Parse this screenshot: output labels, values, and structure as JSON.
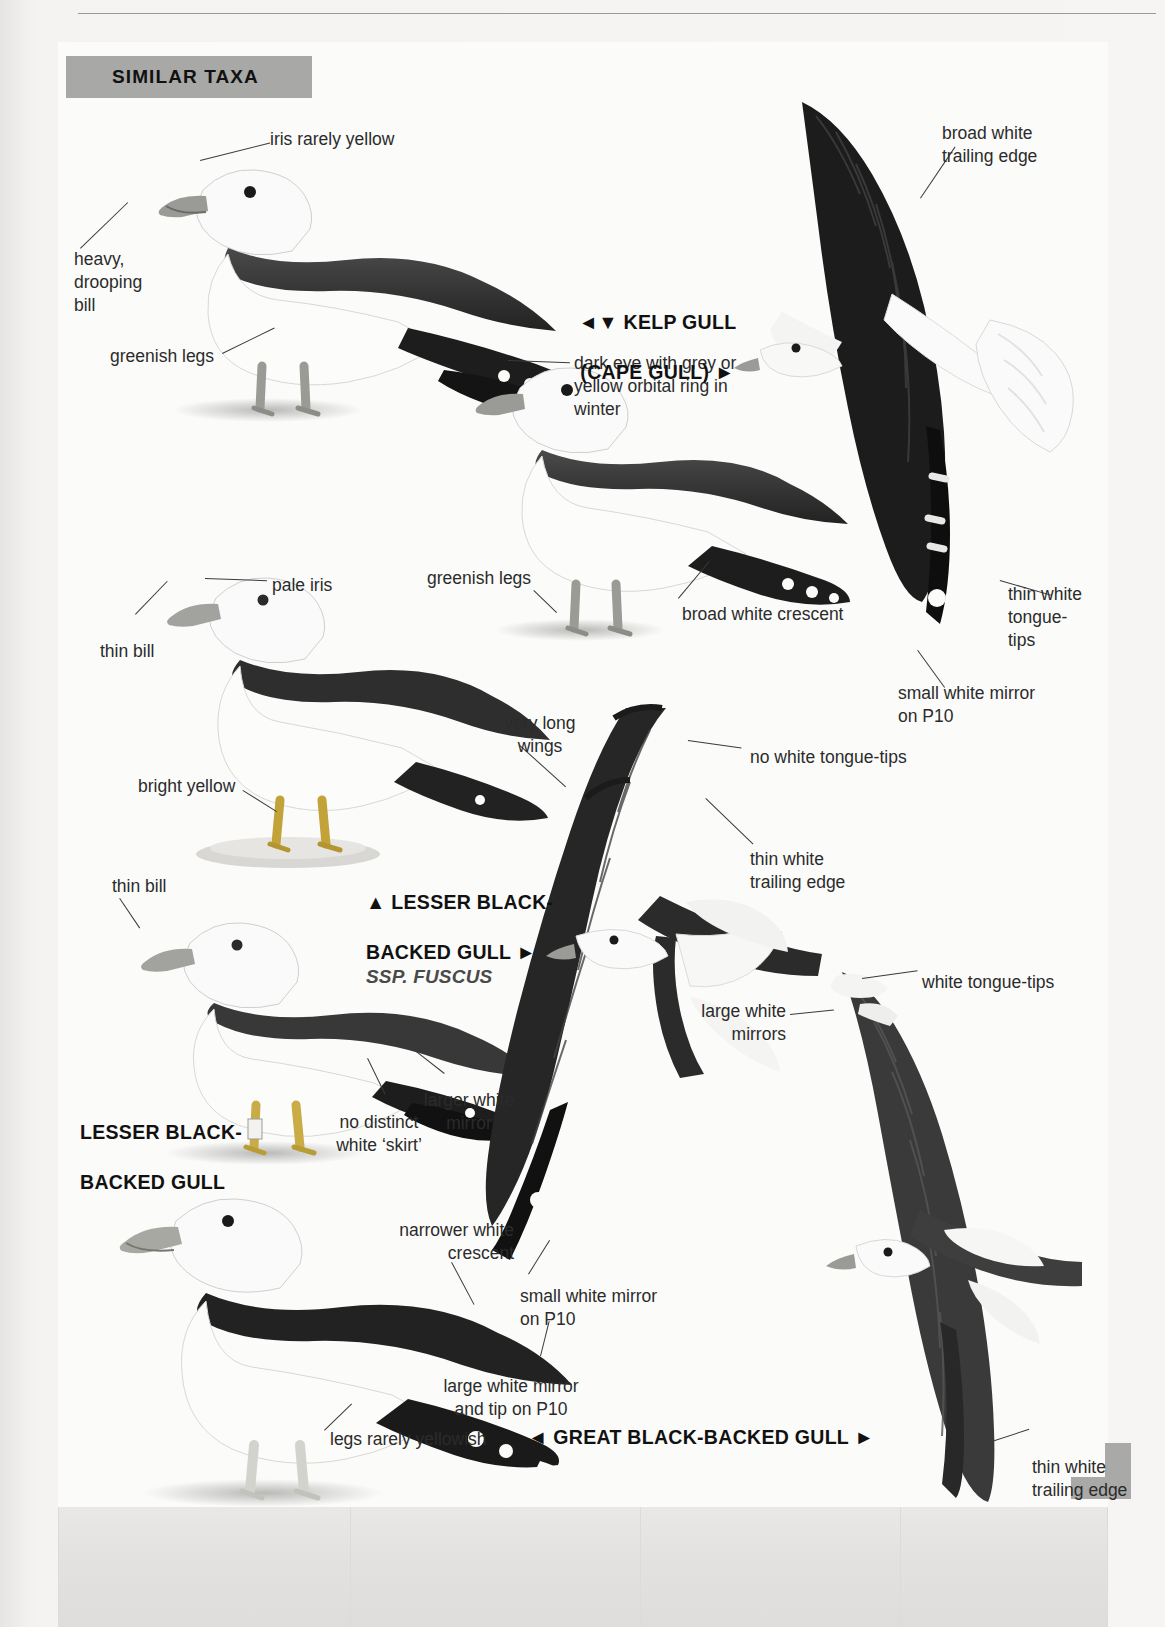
{
  "page": {
    "section_header": "SIMILAR TAXA",
    "accent_grey": "#a8a8a6",
    "paper": "#fbfbfa",
    "text_color": "#2b2b2b"
  },
  "species_labels": [
    {
      "id": "kelp-gull",
      "line1": "◄▼ KELP GULL",
      "line2": "(CAPE GULL) ►",
      "ssp": ""
    },
    {
      "id": "lesser-black-backed-gull-fuscus",
      "line1": "▲ LESSER BLACK-",
      "line2": "BACKED GULL ►",
      "ssp": "SSP. FUSCUS"
    },
    {
      "id": "lesser-black-backed-gull",
      "line1": "LESSER BLACK-",
      "line2": "BACKED GULL",
      "ssp": ""
    },
    {
      "id": "great-black-backed-gull",
      "line1": "◄ GREAT BLACK-BACKED GULL ►",
      "line2": "",
      "ssp": ""
    }
  ],
  "annotations": [
    {
      "id": "iris-rarely-yellow",
      "text": "iris rarely yellow"
    },
    {
      "id": "heavy-drooping-bill",
      "text": "heavy,\ndrooping\nbill"
    },
    {
      "id": "greenish-legs-1",
      "text": "greenish legs"
    },
    {
      "id": "broad-white-trailing-edge",
      "text": "broad white\ntrailing edge"
    },
    {
      "id": "dark-eye-orbital-ring",
      "text": "dark eye with grey or\nyellow orbital ring in\nwinter"
    },
    {
      "id": "pale-iris",
      "text": "pale iris"
    },
    {
      "id": "greenish-legs-2",
      "text": "greenish legs"
    },
    {
      "id": "broad-white-crescent",
      "text": "broad white crescent"
    },
    {
      "id": "thin-white-tongue-tips",
      "text": "thin white\ntongue-\ntips"
    },
    {
      "id": "small-white-mirror-p10-1",
      "text": "small white mirror\non P10"
    },
    {
      "id": "thin-bill-1",
      "text": "thin bill"
    },
    {
      "id": "very-long-wings",
      "text": "very long\nwings"
    },
    {
      "id": "no-white-tongue-tips",
      "text": "no white tongue-tips"
    },
    {
      "id": "bright-yellow",
      "text": "bright yellow"
    },
    {
      "id": "thin-white-trailing-edge-1",
      "text": "thin white\ntrailing edge"
    },
    {
      "id": "thin-bill-2",
      "text": "thin bill"
    },
    {
      "id": "white-tongue-tips",
      "text": "white tongue-tips"
    },
    {
      "id": "large-white-mirrors",
      "text": "large white\nmirrors"
    },
    {
      "id": "larger-white-mirror",
      "text": "larger white\nmirror"
    },
    {
      "id": "no-distinct-white-skirt",
      "text": "no distinct\nwhite ‘skirt’"
    },
    {
      "id": "narrower-white-crescent",
      "text": "narrower white\ncrescent"
    },
    {
      "id": "small-white-mirror-p10-2",
      "text": "small white mirror\non P10"
    },
    {
      "id": "large-white-mirror-tip-p10",
      "text": "large white mirror\nand tip on P10"
    },
    {
      "id": "legs-rarely-yellowish",
      "text": "legs rarely yellowish"
    },
    {
      "id": "thin-white-trailing-edge-2",
      "text": "thin white\ntrailing edge"
    }
  ],
  "figures": [
    {
      "id": "kelp-gull-standing-adult",
      "caption": "standing adult Kelp Gull, left profile"
    },
    {
      "id": "kelp-gull-standing-winter",
      "caption": "standing Kelp Gull in winter, right profile"
    },
    {
      "id": "kelp-gull-flight-underwing",
      "caption": "Kelp Gull in flight, underwing"
    },
    {
      "id": "lesser-black-backed-fuscus-standing",
      "caption": "standing Lesser Black-backed Gull ssp. fuscus"
    },
    {
      "id": "lesser-black-backed-standing",
      "caption": "standing Lesser Black-backed Gull"
    },
    {
      "id": "lesser-black-backed-flight",
      "caption": "Lesser Black-backed Gull in flight, upperwing"
    },
    {
      "id": "great-black-backed-standing",
      "caption": "standing Great Black-backed Gull"
    },
    {
      "id": "great-black-backed-flight",
      "caption": "Great Black-backed Gull in flight, upperwing"
    }
  ]
}
